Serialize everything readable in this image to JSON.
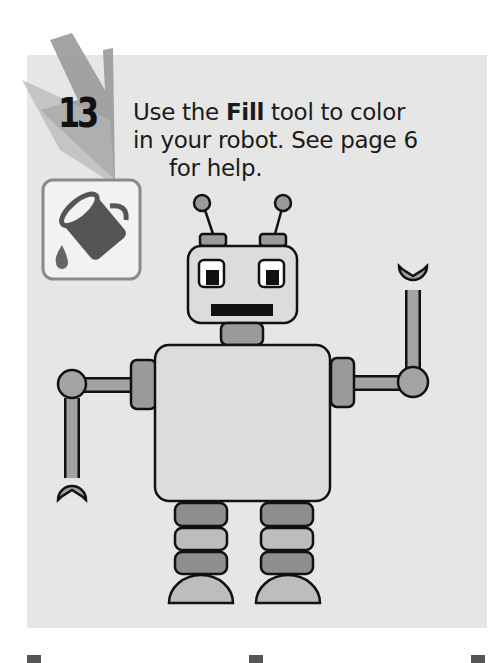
{
  "step": {
    "number": "13",
    "instruction_pre": "Use the ",
    "instruction_bold": "Fill",
    "instruction_line1_post": " tool to color",
    "instruction_line2": "in your robot. See page 6",
    "instruction_line3": "for help."
  },
  "icons": {
    "fill_tool": "paint-bucket-icon"
  },
  "colors": {
    "panel_bg": "#e6e6e6",
    "robot_fill_light": "#d8d8d8",
    "robot_fill_mid": "#a3a3a3",
    "robot_fill_dark": "#8e8e8e",
    "outline": "#111111"
  }
}
